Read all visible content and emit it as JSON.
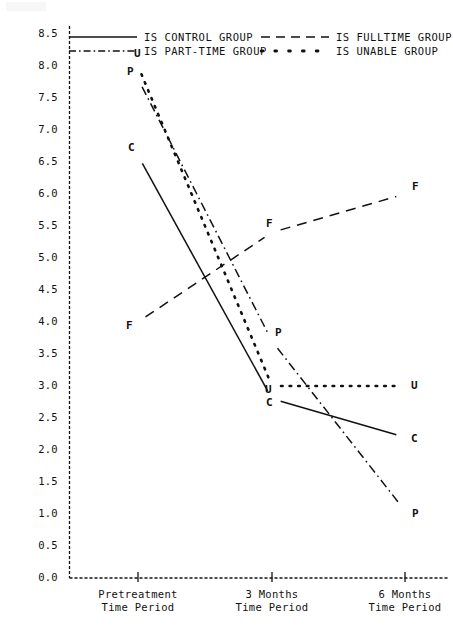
{
  "chart_data": {
    "type": "line",
    "title": "",
    "xlabel": "",
    "ylabel": "",
    "x": [
      "Pretreatment\nTime Period",
      "3 Months\nTime Period",
      "6 Months\nTime Period"
    ],
    "categories": [
      "Pretreatment",
      "3 Months",
      "6 Months"
    ],
    "ylim": [
      0.0,
      8.5
    ],
    "ytick_labels": [
      "8.5",
      "8.0",
      "7.5",
      "7.0",
      "6.5",
      "6.0",
      "5.5",
      "5.0",
      "4.5",
      "4.0",
      "3.5",
      "3.0",
      "2.5",
      "2.0",
      "1.5",
      "1.0",
      "0.5",
      "0.0"
    ],
    "ytick_values": [
      8.5,
      8.0,
      7.5,
      7.0,
      6.5,
      6.0,
      5.5,
      5.0,
      4.5,
      4.0,
      3.5,
      3.0,
      2.5,
      2.0,
      1.5,
      1.0,
      0.5,
      0.0
    ],
    "grid": false,
    "legend_position": "top-inside",
    "series": [
      {
        "name": "IS CONTROL GROUP",
        "key": "control",
        "marker_letter": "C",
        "style": "solid",
        "values": [
          6.6,
          2.8,
          2.2
        ]
      },
      {
        "name": "IS FULLTIME GROUP",
        "key": "fulltime",
        "marker_letter": "F",
        "style": "dashed",
        "values": [
          4.0,
          5.4,
          6.0
        ]
      },
      {
        "name": "IS PART-TIME GROUP",
        "key": "parttime",
        "marker_letter": "P",
        "style": "dashdot",
        "values": [
          7.8,
          3.7,
          1.05
        ]
      },
      {
        "name": "IS UNABLE GROUP",
        "key": "unable",
        "marker_letter": "U",
        "style": "dotted",
        "values": [
          8.0,
          3.0,
          3.0
        ]
      }
    ]
  },
  "legend": {
    "entries": [
      {
        "label": "IS CONTROL GROUP",
        "style": "solid"
      },
      {
        "label": "IS FULLTIME GROUP",
        "style": "dashed"
      },
      {
        "label": "IS PART-TIME GROUP",
        "style": "dashdot"
      },
      {
        "label": "IS UNABLE GROUP",
        "style": "dotted"
      }
    ]
  },
  "axis": {
    "x_labels": [
      {
        "line1": "Pretreatment",
        "line2": "Time Period"
      },
      {
        "line1": "3 Months",
        "line2": "Time Period"
      },
      {
        "line1": "6 Months",
        "line2": "Time Period"
      }
    ]
  },
  "point_labels": {
    "control": [
      "C",
      "C",
      "C"
    ],
    "fulltime": [
      "F",
      "F",
      "F"
    ],
    "parttime": [
      "P",
      "P",
      "P"
    ],
    "unable": [
      "U",
      "U",
      "U"
    ]
  },
  "colors": {
    "ink": "#111111",
    "background": "#ffffff"
  }
}
